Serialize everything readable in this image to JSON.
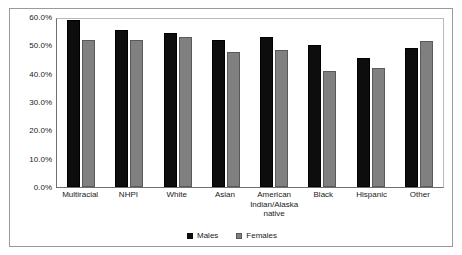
{
  "chart_data": {
    "type": "bar",
    "title": "",
    "subtitle": "",
    "xlabel": "",
    "ylabel": "",
    "ylim": [
      0,
      60
    ],
    "grid": false,
    "legend_position": "bottom-center",
    "ytick_labels": [
      "60.0%",
      "50.0%",
      "40.0%",
      "30.0%",
      "20.0%",
      "10.0%",
      "0.0%"
    ],
    "ytick_values": [
      60,
      50,
      40,
      30,
      20,
      10,
      0
    ],
    "categories": [
      "Multiracial",
      "NHPI",
      "White",
      "Asian",
      "American Indian/Alaska native",
      "Black",
      "Hispanic",
      "Other"
    ],
    "series": [
      {
        "name": "Males",
        "color": "#0d0d0d",
        "values": [
          59.0,
          55.5,
          54.5,
          52.0,
          53.0,
          50.0,
          45.5,
          49.0
        ]
      },
      {
        "name": "Females",
        "color": "#808080",
        "values": [
          52.0,
          52.0,
          53.0,
          47.5,
          48.5,
          41.0,
          42.0,
          51.5
        ]
      }
    ]
  }
}
